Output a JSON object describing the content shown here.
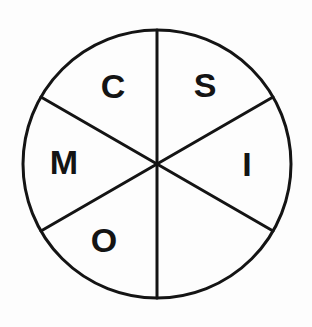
{
  "figure": {
    "background_color": "#fdfdfd",
    "stroke_color": "#141414",
    "text_color": "#141414"
  },
  "circle": {
    "center_x": 157,
    "center_y": 164,
    "radius": 134,
    "stroke_width": 3
  },
  "dividers": [
    {
      "name": "vertical-diameter",
      "angle_deg": 90,
      "stroke_width": 3
    },
    {
      "name": "diagonal-diameter-upper-left-to-lower-right",
      "angle_deg": 30,
      "stroke_width": 3
    },
    {
      "name": "diagonal-diameter-upper-right-to-lower-left",
      "angle_deg": 150,
      "stroke_width": 3
    }
  ],
  "sectors": [
    {
      "name": "sector-upper-left",
      "label": "C",
      "label_x": 113,
      "label_y": 86,
      "font_size": 34,
      "start_angle_deg": 90,
      "end_angle_deg": 150
    },
    {
      "name": "sector-upper-right",
      "label": "S",
      "label_x": 205,
      "label_y": 85,
      "font_size": 34,
      "start_angle_deg": 30,
      "end_angle_deg": 90
    },
    {
      "name": "sector-right",
      "label": "I",
      "label_x": 247,
      "label_y": 164,
      "font_size": 34,
      "start_angle_deg": -30,
      "end_angle_deg": 30
    },
    {
      "name": "sector-lower-right",
      "label": "",
      "label_x": 205,
      "label_y": 243,
      "font_size": 34,
      "start_angle_deg": -90,
      "end_angle_deg": -30
    },
    {
      "name": "sector-lower-left",
      "label": "O",
      "label_x": 104,
      "label_y": 240,
      "font_size": 34,
      "start_angle_deg": -150,
      "end_angle_deg": -90
    },
    {
      "name": "sector-left",
      "label": "M",
      "label_x": 64,
      "label_y": 162,
      "font_size": 34,
      "start_angle_deg": 150,
      "end_angle_deg": 210
    }
  ],
  "letters_clockwise_from_top": [
    "S",
    "I",
    "",
    "O",
    "M",
    "C"
  ]
}
